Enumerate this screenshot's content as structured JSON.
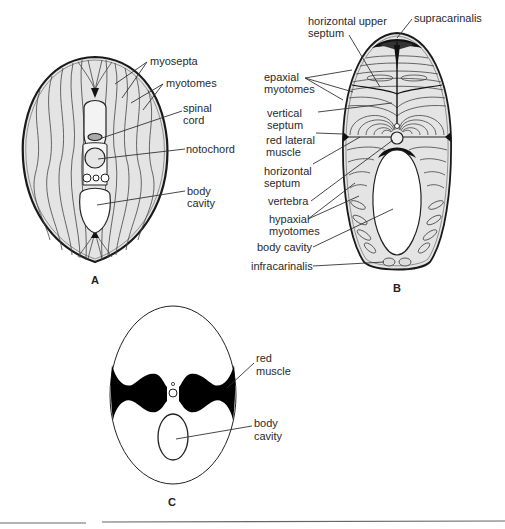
{
  "figure": {
    "panels": [
      {
        "id": "A",
        "label": "A",
        "annotations": [
          {
            "text_lines": [
              "myosepta"
            ]
          },
          {
            "text_lines": [
              "myotomes"
            ]
          },
          {
            "text_lines": [
              "spinal",
              "cord"
            ]
          },
          {
            "text_lines": [
              "notochord"
            ]
          },
          {
            "text_lines": [
              "body",
              "cavity"
            ]
          }
        ]
      },
      {
        "id": "B",
        "label": "B",
        "annotations": [
          {
            "text_lines": [
              "horizontal upper",
              "septum"
            ]
          },
          {
            "text_lines": [
              "supracarinalis"
            ]
          },
          {
            "text_lines": [
              "epaxial",
              "myotomes"
            ]
          },
          {
            "text_lines": [
              "vertical",
              "septum"
            ]
          },
          {
            "text_lines": [
              "red lateral",
              "muscle"
            ]
          },
          {
            "text_lines": [
              "horizontal",
              "septum"
            ]
          },
          {
            "text_lines": [
              "vertebra"
            ]
          },
          {
            "text_lines": [
              "hypaxial",
              "myotomes"
            ]
          },
          {
            "text_lines": [
              "body cavity"
            ]
          },
          {
            "text_lines": [
              "infracarinalis"
            ]
          }
        ]
      },
      {
        "id": "C",
        "label": "C",
        "annotations": [
          {
            "text_lines": [
              "red",
              "muscle"
            ]
          },
          {
            "text_lines": [
              "body",
              "cavity"
            ]
          }
        ]
      }
    ],
    "colors": {
      "muscle_fill": "#e4e4e4",
      "outline": "#1a1a1a",
      "red_muscle": "#000000"
    }
  }
}
